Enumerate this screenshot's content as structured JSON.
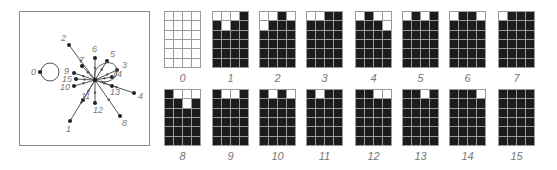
{
  "state_graph": {
    "nodes": [
      {
        "id": "0",
        "x": 20,
        "y": 60
      },
      {
        "id": "1",
        "x": 50,
        "y": 109
      },
      {
        "id": "2",
        "x": 49,
        "y": 33
      },
      {
        "id": "3",
        "x": 97,
        "y": 58
      },
      {
        "id": "4",
        "x": 114,
        "y": 81
      },
      {
        "id": "5",
        "x": 87,
        "y": 49
      },
      {
        "id": "6",
        "x": 75,
        "y": 46
      },
      {
        "id": "7",
        "x": 62,
        "y": 54
      },
      {
        "id": "8",
        "x": 100,
        "y": 104
      },
      {
        "id": "9",
        "x": 54,
        "y": 61
      },
      {
        "id": "10",
        "x": 54,
        "y": 74
      },
      {
        "id": "11",
        "x": 63,
        "y": 88
      },
      {
        "id": "12",
        "x": 75,
        "y": 91
      },
      {
        "id": "13",
        "x": 92,
        "y": 74
      },
      {
        "id": "14",
        "x": 92,
        "y": 65
      },
      {
        "id": "15",
        "x": 56,
        "y": 67
      }
    ],
    "hub": {
      "x": 75,
      "y": 68
    }
  },
  "grids": [
    {
      "label": "0",
      "white_cells": [
        [
          0,
          0
        ],
        [
          0,
          1
        ],
        [
          0,
          2
        ],
        [
          0,
          3
        ],
        [
          1,
          0
        ],
        [
          1,
          1
        ],
        [
          1,
          2
        ],
        [
          1,
          3
        ],
        [
          2,
          0
        ],
        [
          2,
          1
        ],
        [
          2,
          2
        ],
        [
          2,
          3
        ],
        [
          3,
          0
        ],
        [
          3,
          1
        ],
        [
          3,
          2
        ],
        [
          3,
          3
        ],
        [
          4,
          0
        ],
        [
          4,
          1
        ],
        [
          4,
          2
        ],
        [
          4,
          3
        ],
        [
          5,
          0
        ],
        [
          5,
          1
        ],
        [
          5,
          2
        ],
        [
          5,
          3
        ]
      ]
    },
    {
      "label": "1",
      "white_cells": [
        [
          0,
          0
        ],
        [
          0,
          1
        ],
        [
          0,
          2
        ],
        [
          1,
          1
        ]
      ]
    },
    {
      "label": "2",
      "white_cells": [
        [
          0,
          0
        ],
        [
          0,
          1
        ],
        [
          0,
          3
        ],
        [
          1,
          0
        ]
      ]
    },
    {
      "label": "3",
      "white_cells": [
        [
          0,
          0
        ],
        [
          0,
          1
        ]
      ]
    },
    {
      "label": "4",
      "white_cells": [
        [
          0,
          0
        ],
        [
          0,
          2
        ],
        [
          0,
          3
        ],
        [
          1,
          3
        ]
      ]
    },
    {
      "label": "5",
      "white_cells": [
        [
          0,
          0
        ],
        [
          0,
          2
        ]
      ]
    },
    {
      "label": "6",
      "white_cells": [
        [
          0,
          0
        ],
        [
          0,
          3
        ]
      ]
    },
    {
      "label": "7",
      "white_cells": [
        [
          0,
          0
        ]
      ]
    },
    {
      "label": "8",
      "white_cells": [
        [
          0,
          1
        ],
        [
          0,
          2
        ],
        [
          0,
          3
        ],
        [
          1,
          2
        ]
      ]
    },
    {
      "label": "9",
      "white_cells": [
        [
          0,
          1
        ],
        [
          0,
          2
        ]
      ]
    },
    {
      "label": "10",
      "white_cells": [
        [
          0,
          1
        ],
        [
          0,
          3
        ]
      ]
    },
    {
      "label": "11",
      "white_cells": [
        [
          0,
          1
        ]
      ]
    },
    {
      "label": "12",
      "white_cells": [
        [
          0,
          2
        ],
        [
          0,
          3
        ]
      ]
    },
    {
      "label": "13",
      "white_cells": [
        [
          0,
          2
        ]
      ]
    },
    {
      "label": "14",
      "white_cells": [
        [
          0,
          3
        ]
      ]
    },
    {
      "label": "15",
      "white_cells": []
    }
  ],
  "colors": {
    "line": "#555555",
    "filled": "#1c1c1c",
    "empty": "#ffffff",
    "label": "#777777"
  }
}
